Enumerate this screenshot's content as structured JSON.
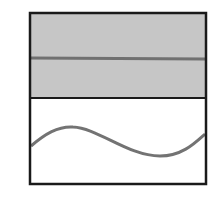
{
  "diagram": {
    "panels": [
      {
        "name": "top-panel",
        "fill": "#c4c4c4",
        "feature": "horizontal-line"
      },
      {
        "name": "bottom-panel",
        "fill": "#ffffff",
        "feature": "sine-wave"
      }
    ],
    "colors": {
      "border": "#1a1a1a",
      "line": "#707070",
      "shaded": "#c6c6c6",
      "background": "#ffffff"
    }
  }
}
